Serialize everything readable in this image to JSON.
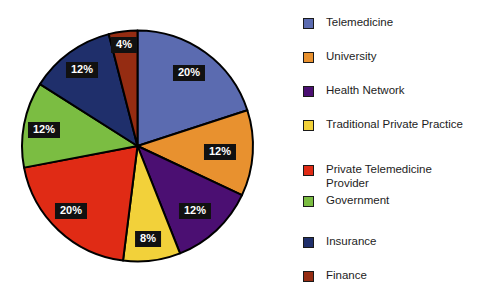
{
  "chart_data": {
    "type": "pie",
    "title": "",
    "subtitle": "",
    "legend_position": "right",
    "categories": [
      "Telemedicine",
      "University",
      "Health Network",
      "Traditional Private Practice",
      "Private Telemedicine Provider",
      "Government",
      "Insurance",
      "Finance"
    ],
    "values": [
      20,
      12,
      12,
      8,
      20,
      12,
      12,
      4
    ],
    "value_labels": [
      "20%",
      "12%",
      "12%",
      "8%",
      "20%",
      "12%",
      "12%",
      "4%"
    ],
    "colors": [
      "#5b6bb0",
      "#e8912f",
      "#4b0f72",
      "#f2d13a",
      "#e02b15",
      "#7bbd42",
      "#1f2f6b",
      "#952c12"
    ],
    "units": "percent",
    "start_angle_deg": 0,
    "direction": "clockwise"
  },
  "pie": {
    "slices": [
      {
        "name": "Telemedicine",
        "label": "20%",
        "value": 20,
        "color": "#5b6bb0",
        "label_x": 189,
        "label_y": 73
      },
      {
        "name": "University",
        "label": "12%",
        "value": 12,
        "color": "#e8912f",
        "label_x": 220,
        "label_y": 152
      },
      {
        "name": "Health Network",
        "label": "12%",
        "value": 12,
        "color": "#4b0f72",
        "label_x": 195,
        "label_y": 211
      },
      {
        "name": "Traditional Private Practice",
        "label": "8%",
        "value": 8,
        "color": "#f2d13a",
        "label_x": 148,
        "label_y": 239
      },
      {
        "name": "Private Telemedicine Provider",
        "label": "20%",
        "value": 20,
        "color": "#e02b15",
        "label_x": 71,
        "label_y": 211
      },
      {
        "name": "Government",
        "label": "12%",
        "value": 12,
        "color": "#7bbd42",
        "label_x": 44,
        "label_y": 130
      },
      {
        "name": "Insurance",
        "label": "12%",
        "value": 12,
        "color": "#1f2f6b",
        "label_x": 82,
        "label_y": 70
      },
      {
        "name": "Finance",
        "label": "4%",
        "value": 4,
        "color": "#952c12",
        "label_x": 124,
        "label_y": 45
      }
    ]
  },
  "legend": {
    "items": [
      {
        "label": "Telemedicine",
        "color": "#5b6bb0",
        "y": 16
      },
      {
        "label": "University",
        "color": "#e8912f",
        "y": 50
      },
      {
        "label": "Health Network",
        "color": "#4b0f72",
        "y": 84
      },
      {
        "label": "Traditional Private Practice",
        "color": "#f2d13a",
        "y": 118
      },
      {
        "label": "Private Telemedicine\nProvider",
        "color": "#e02b15",
        "y": 163
      },
      {
        "label": "Government",
        "color": "#7bbd42",
        "y": 194
      },
      {
        "label": "Insurance",
        "color": "#1f2f6b",
        "y": 235
      },
      {
        "label": "Finance",
        "color": "#952c12",
        "y": 269
      }
    ]
  }
}
